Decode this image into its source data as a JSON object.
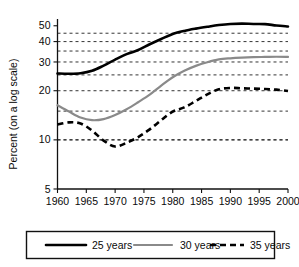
{
  "chart_data": {
    "type": "line",
    "title": "",
    "xlabel": "",
    "ylabel": "Percent (on a log scale)",
    "yscale": "log",
    "ylim": [
      5,
      55
    ],
    "xlim": [
      1960,
      2000
    ],
    "grid": true,
    "gridlines_y": [
      10,
      15,
      25,
      35,
      45
    ],
    "ytick_labels": [
      "50",
      "40",
      "30",
      "20",
      "10",
      "5"
    ],
    "ytick_values": [
      50,
      40,
      30,
      20,
      10,
      5
    ],
    "xtick_labels": [
      "1960",
      "1965",
      "1970",
      "1975",
      "1980",
      "1985",
      "1990",
      "1995",
      "2000"
    ],
    "xtick_values": [
      1960,
      1965,
      1970,
      1975,
      1980,
      1985,
      1990,
      1995,
      2000
    ],
    "legend_position": "below",
    "x": [
      1960,
      1962,
      1964,
      1966,
      1968,
      1970,
      1972,
      1974,
      1976,
      1978,
      1980,
      1982,
      1984,
      1986,
      1988,
      1990,
      1992,
      1994,
      1996,
      1998,
      2000
    ],
    "series": [
      {
        "name": "25 years",
        "color": "#000000",
        "style": "solid-thick",
        "values": [
          25.5,
          25.4,
          25.6,
          26.5,
          28.5,
          31.0,
          33.5,
          35.5,
          38.5,
          41.5,
          44.5,
          46.5,
          48.0,
          49.3,
          50.5,
          51.3,
          51.5,
          51.3,
          51.2,
          50.2,
          49.5
        ]
      },
      {
        "name": "30 years",
        "color": "#8a8a8a",
        "style": "solid",
        "values": [
          16.3,
          14.9,
          13.7,
          13.2,
          13.4,
          14.2,
          15.4,
          17.0,
          18.9,
          21.5,
          24.2,
          26.5,
          28.4,
          29.9,
          31.1,
          31.6,
          31.9,
          32.1,
          32.2,
          32.3,
          32.2
        ]
      },
      {
        "name": "35 years",
        "color": "#000000",
        "style": "dashed",
        "values": [
          12.4,
          12.8,
          12.6,
          11.4,
          9.9,
          9.1,
          9.6,
          10.4,
          11.6,
          13.2,
          14.9,
          15.8,
          17.3,
          19.0,
          20.4,
          20.8,
          20.7,
          20.6,
          20.5,
          20.3,
          19.9
        ]
      }
    ]
  },
  "legend": {
    "items": [
      {
        "label": "25 years",
        "color": "#000000",
        "style": "solid-thick"
      },
      {
        "label": "30 years",
        "color": "#8a8a8a",
        "style": "solid"
      },
      {
        "label": "35 years",
        "color": "#000000",
        "style": "dashed"
      }
    ]
  }
}
